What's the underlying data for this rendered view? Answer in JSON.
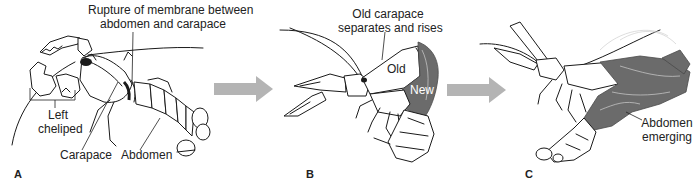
{
  "figure": {
    "colors": {
      "line": "#1a1a1a",
      "new_shell": "#6b6b6b",
      "arrow": "#b4b4b4",
      "background": "#ffffff"
    },
    "arrows": [
      {
        "from": "A",
        "to": "B"
      },
      {
        "from": "B",
        "to": "C"
      }
    ],
    "panels": [
      {
        "letter": "A",
        "labels": {
          "rupture_line1": "Rupture of membrane between",
          "rupture_line2": "abdomen and carapace",
          "cheliped_line1": "Left",
          "cheliped_line2": "cheliped",
          "carapace": "Carapace",
          "abdomen": "Abdomen"
        }
      },
      {
        "letter": "B",
        "labels": {
          "old_carapace_line1": "Old carapace",
          "old_carapace_line2": "separates and rises",
          "old": "Old",
          "new": "New"
        }
      },
      {
        "letter": "C",
        "labels": {
          "abdomen_line1": "Abdomen",
          "abdomen_line2": "emerging"
        }
      }
    ]
  }
}
